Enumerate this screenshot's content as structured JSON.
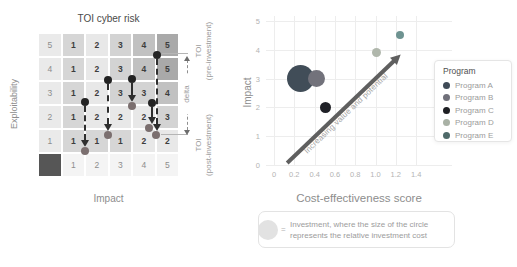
{
  "chart_data": [
    {
      "type": "heatmap",
      "title": "TOI cyber risk",
      "xlabel": "Impact",
      "ylabel": "Exploitability",
      "x_labels": [
        1,
        2,
        3,
        4,
        5
      ],
      "y_labels": [
        5,
        4,
        3,
        2,
        1
      ],
      "rows": [
        [
          1,
          2,
          3,
          4,
          5
        ],
        [
          1,
          2,
          3,
          4,
          5
        ],
        [
          1,
          2,
          3,
          3,
          4
        ],
        [
          1,
          2,
          2,
          2,
          3
        ],
        [
          1,
          1,
          1,
          2,
          2
        ]
      ],
      "movements": [
        {
          "pre": {
            "impact": 2,
            "exploitability": 3
          },
          "post": {
            "impact": 2,
            "exploitability": 1
          }
        },
        {
          "pre": {
            "impact": 3,
            "exploitability": 4
          },
          "post": {
            "impact": 3,
            "exploitability": 1
          }
        },
        {
          "pre": {
            "impact": 4,
            "exploitability": 4
          },
          "post": {
            "impact": 4,
            "exploitability": 3
          }
        },
        {
          "pre": {
            "impact": 5,
            "exploitability": 3
          },
          "post": {
            "impact": 5,
            "exploitability": 2
          }
        },
        {
          "pre": {
            "impact": 5,
            "exploitability": 5
          },
          "post": {
            "impact": 5,
            "exploitability": 1
          }
        }
      ],
      "annotations": [
        "TOI (pre-investment)",
        "delta",
        "TOI (post-investment)"
      ]
    },
    {
      "type": "scatter",
      "xlabel": "Cost-effectiveness score",
      "ylabel": "Impact",
      "xlim": [
        0,
        1.4
      ],
      "ylim": [
        0,
        5
      ],
      "x_ticks": [
        0,
        0.2,
        0.4,
        0.6,
        0.8,
        1.0,
        1.2,
        1.4
      ],
      "y_ticks": [
        0,
        1,
        2,
        3,
        4,
        5
      ],
      "legend_title": "Program",
      "series": [
        {
          "name": "Program A",
          "x": 0.26,
          "y": 3.0,
          "bubble_size": "large"
        },
        {
          "name": "Program B",
          "x": 0.42,
          "y": 3.0,
          "bubble_size": "medium"
        },
        {
          "name": "Program C",
          "x": 0.51,
          "y": 2.0,
          "bubble_size": "small"
        },
        {
          "name": "Program D",
          "x": 1.01,
          "y": 3.9,
          "bubble_size": "small"
        },
        {
          "name": "Program E",
          "x": 1.24,
          "y": 4.5,
          "bubble_size": "small"
        }
      ],
      "annotation": "Increasing value and potential"
    }
  ],
  "matrix": {
    "title": "TOI cyber risk",
    "y_axis_label": "Exploitability",
    "x_axis_label": "Impact",
    "y_tick_labels": [
      "5",
      "4",
      "3",
      "2",
      "1"
    ],
    "x_tick_labels": [
      "1",
      "2",
      "3",
      "4",
      "5"
    ],
    "values": [
      [
        1,
        2,
        3,
        4,
        5
      ],
      [
        1,
        2,
        3,
        4,
        5
      ],
      [
        1,
        2,
        3,
        3,
        4
      ],
      [
        1,
        2,
        2,
        2,
        3
      ],
      [
        1,
        1,
        1,
        2,
        2
      ]
    ],
    "value_shades": {
      "1": "#d6d6d6",
      "2": "#e8e8e8",
      "3": "#d3d3d3",
      "4": "#c1c1c1",
      "5": "#a9a9a9"
    },
    "label_bg": "#eaeaea",
    "bottom_label_bg": "#f4f4f4",
    "corner_color": "#565656",
    "label_text_color": "#8d8d8d",
    "cell_text_color": "#3d3d3d",
    "pre_dot_color": "#232323",
    "post_dot_color": "#7b6f6f",
    "movements": [
      {
        "pre_px": {
          "x": 47,
          "y": 69
        },
        "post_px": {
          "x": 47,
          "y": 118
        }
      },
      {
        "pre_px": {
          "x": 70,
          "y": 47
        },
        "post_px": {
          "x": 70,
          "y": 102
        }
      },
      {
        "pre_px": {
          "x": 94,
          "y": 46
        },
        "post_px": {
          "x": 94,
          "y": 73
        }
      },
      {
        "pre_px": {
          "x": 114,
          "y": 70
        },
        "post_px": {
          "x": 111,
          "y": 95
        }
      },
      {
        "pre_px": {
          "x": 119,
          "y": 22
        },
        "post_px": {
          "x": 118,
          "y": 102
        }
      }
    ],
    "pre_label_line1": "TOI",
    "pre_label_line2": "(pre-investment)",
    "post_label_line1": "TOI",
    "post_label_line2": "(post-investment)",
    "delta_label": "delta"
  },
  "scatter": {
    "y_axis_label": "Impact",
    "x_axis_label": "Cost-effectiveness score",
    "x_ticks": [
      "0",
      "0.2",
      "0.4",
      "0.6",
      "0.8",
      "1.0",
      "1.2",
      "1.4"
    ],
    "y_ticks": [
      "0",
      "1",
      "2",
      "3",
      "4",
      "5"
    ],
    "arrow_label": "Increasing value and potential",
    "points": [
      {
        "name": "Program A",
        "x": 0.26,
        "y": 3.0,
        "r": 13.5,
        "color": "#414d58"
      },
      {
        "name": "Program B",
        "x": 0.42,
        "y": 3.0,
        "r": 8.5,
        "color": "#72727b"
      },
      {
        "name": "Program C",
        "x": 0.51,
        "y": 2.0,
        "r": 5.5,
        "color": "#202127"
      },
      {
        "name": "Program D",
        "x": 1.01,
        "y": 3.9,
        "r": 4.5,
        "color": "#b0b7ac"
      },
      {
        "name": "Program E",
        "x": 1.24,
        "y": 4.5,
        "r": 4.0,
        "color": "#6e9391"
      }
    ],
    "legend": {
      "title": "Program",
      "items": [
        {
          "label": "Program A",
          "color": "#3f4b57"
        },
        {
          "label": "Program B",
          "color": "#70707a"
        },
        {
          "label": "Program C",
          "color": "#1e1f23"
        },
        {
          "label": "Program D",
          "color": "#a9b1a5"
        },
        {
          "label": "Program E",
          "color": "#4f6a69"
        }
      ]
    }
  },
  "note": {
    "equals": "=",
    "line1": "Investment, where the size of the circle",
    "line2": "represents the relative investment cost"
  }
}
